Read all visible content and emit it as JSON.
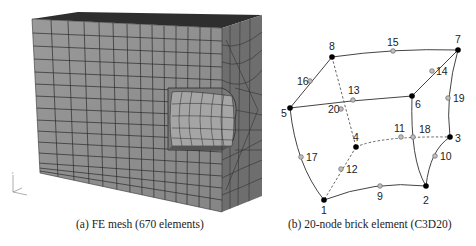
{
  "figure": {
    "panels": [
      {
        "id": "a",
        "caption": "(a)  FE mesh (670 elements)",
        "description": "3D finite element mesh of a block with a semi-cylindrical notch",
        "element_count": 670
      },
      {
        "id": "b",
        "caption": "(b)  20-node brick element (C3D20)",
        "element_type": "C3D20",
        "corner_nodes": [
          "1",
          "2",
          "3",
          "4",
          "5",
          "6",
          "7",
          "8"
        ],
        "midside_nodes": [
          "9",
          "10",
          "11",
          "12",
          "13",
          "14",
          "15",
          "16",
          "17",
          "18",
          "19",
          "20"
        ]
      }
    ],
    "colors": {
      "mesh_front": "#8e8e8e",
      "mesh_side": "#6a6a6a",
      "mesh_top": "#2a2a2a",
      "mesh_lines": "#2b2b2b",
      "corner_node": "#000000",
      "midside_node": "#b0b0b0"
    }
  }
}
